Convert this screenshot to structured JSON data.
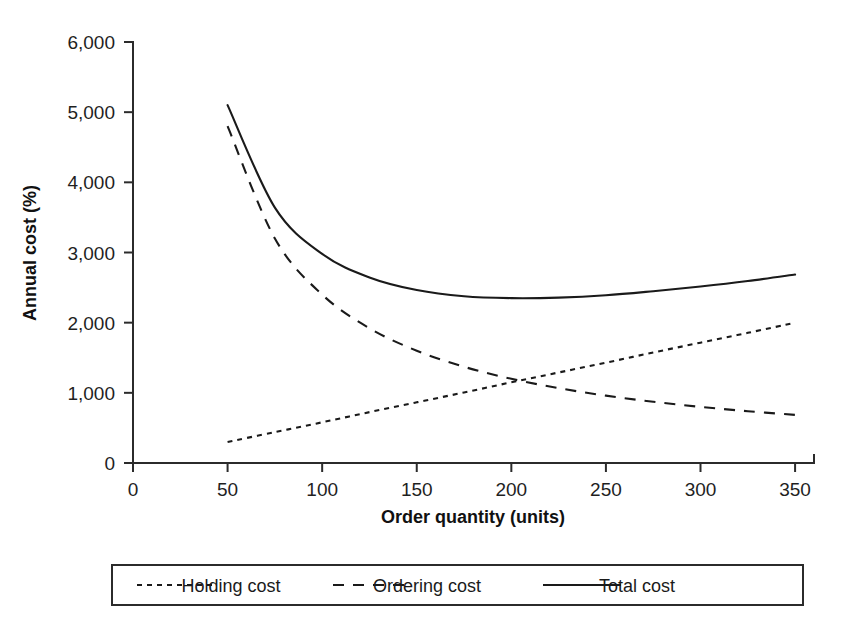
{
  "chart_data": {
    "type": "line",
    "title": "",
    "xlabel": "Order quantity (units)",
    "ylabel": "Annual cost (%)",
    "xlim": [
      0,
      360
    ],
    "ylim": [
      0,
      6000
    ],
    "grid": false,
    "legend_position": "bottom",
    "x_ticks": [
      "0",
      "50",
      "100",
      "150",
      "200",
      "250",
      "300",
      "350"
    ],
    "x_tick_values": [
      0,
      50,
      100,
      150,
      200,
      250,
      300,
      350
    ],
    "y_ticks": [
      "0",
      "1,000",
      "2,000",
      "3,000",
      "4,000",
      "5,000",
      "6,000"
    ],
    "y_tick_values": [
      0,
      1000,
      2000,
      3000,
      4000,
      5000,
      6000
    ],
    "x": [
      50,
      75,
      100,
      125,
      150,
      175,
      200,
      225,
      250,
      275,
      300,
      325,
      350
    ],
    "series": [
      {
        "name": "Holding cost",
        "style": "dotted",
        "values": [
          300,
          440,
          580,
          725,
          865,
          1005,
          1150,
          1290,
          1430,
          1575,
          1715,
          1855,
          2000
        ]
      },
      {
        "name": "Ordering cost",
        "style": "dashed",
        "values": [
          4800,
          3200,
          2400,
          1920,
          1600,
          1371,
          1200,
          1067,
          960,
          873,
          800,
          738,
          686
        ]
      },
      {
        "name": "Total cost",
        "style": "solid",
        "values": [
          5100,
          3640,
          2980,
          2645,
          2465,
          2376,
          2350,
          2357,
          2390,
          2448,
          2515,
          2593,
          2686
        ]
      }
    ],
    "annotations": {
      "minimum_total_cost_x": 200,
      "minimum_total_cost_y": 2350,
      "crossover_x": 200,
      "crossover_y": 1150
    }
  },
  "legend": {
    "items": [
      {
        "label": "Holding cost",
        "style": "dotted"
      },
      {
        "label": "Ordering cost",
        "style": "dashed"
      },
      {
        "label": "Total cost",
        "style": "solid"
      }
    ]
  },
  "colors": {
    "ink": "#1a1a1a",
    "axis": "#2b2b2b",
    "background": "#ffffff"
  }
}
